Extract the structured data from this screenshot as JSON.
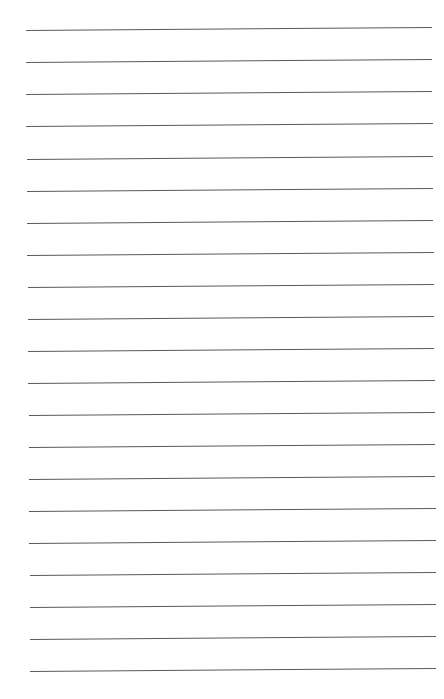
{
  "page": {
    "type": "lined-paper",
    "background": "#ffffff",
    "line_color": "#5a5a5a",
    "line_count": 21,
    "lines": [
      {
        "y": 30,
        "x1": 26,
        "x2": 432
      },
      {
        "y": 62,
        "x1": 26,
        "x2": 432
      },
      {
        "y": 94,
        "x1": 26,
        "x2": 432
      },
      {
        "y": 126,
        "x1": 26,
        "x2": 433
      },
      {
        "y": 159,
        "x1": 27,
        "x2": 433
      },
      {
        "y": 191,
        "x1": 27,
        "x2": 433
      },
      {
        "y": 223,
        "x1": 27,
        "x2": 433
      },
      {
        "y": 255,
        "x1": 27,
        "x2": 434
      },
      {
        "y": 287,
        "x1": 28,
        "x2": 434
      },
      {
        "y": 319,
        "x1": 28,
        "x2": 434
      },
      {
        "y": 351,
        "x1": 28,
        "x2": 434
      },
      {
        "y": 383,
        "x1": 28,
        "x2": 435
      },
      {
        "y": 415,
        "x1": 29,
        "x2": 435
      },
      {
        "y": 447,
        "x1": 29,
        "x2": 435
      },
      {
        "y": 479,
        "x1": 29,
        "x2": 435
      },
      {
        "y": 511,
        "x1": 29,
        "x2": 436
      },
      {
        "y": 543,
        "x1": 29,
        "x2": 436
      },
      {
        "y": 575,
        "x1": 30,
        "x2": 436
      },
      {
        "y": 607,
        "x1": 30,
        "x2": 436
      },
      {
        "y": 639,
        "x1": 30,
        "x2": 436
      },
      {
        "y": 671,
        "x1": 30,
        "x2": 436
      }
    ],
    "text": ""
  }
}
